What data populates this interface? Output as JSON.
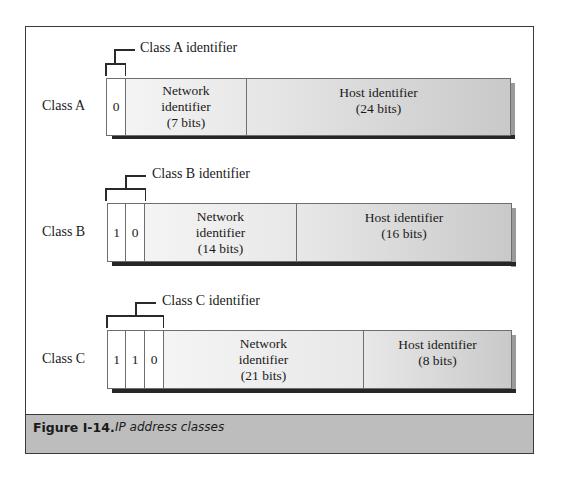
{
  "figure": {
    "number_label": "Figure I-14.",
    "caption": "IP address classes"
  },
  "classes": [
    {
      "name": "Class A",
      "identifier_label": "Class A identifier",
      "bits": [
        "0"
      ],
      "network": {
        "line1": "Network",
        "line2": "identifier",
        "line3": "(7 bits)"
      },
      "host": {
        "line1": "Host identifier",
        "line2": "(24 bits)"
      }
    },
    {
      "name": "Class B",
      "identifier_label": "Class B identifier",
      "bits": [
        "1",
        "0"
      ],
      "network": {
        "line1": "Network",
        "line2": "identifier",
        "line3": "(14 bits)"
      },
      "host": {
        "line1": "Host identifier",
        "line2": "(16 bits)"
      }
    },
    {
      "name": "Class C",
      "identifier_label": "Class C identifier",
      "bits": [
        "1",
        "1",
        "0"
      ],
      "network": {
        "line1": "Network",
        "line2": "identifier",
        "line3": "(21 bits)"
      },
      "host": {
        "line1": "Host identifier",
        "line2": "(8 bits)"
      }
    }
  ],
  "colors": {
    "frame_border": "#3a3a3a",
    "caption_band": "#bdbdbd",
    "shadow_dark": "#262626",
    "shadow_light": "#9a9a9a"
  }
}
